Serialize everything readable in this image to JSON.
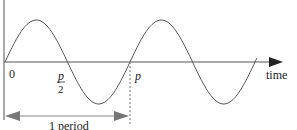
{
  "diagram": {
    "type": "sine-wave-period",
    "axis_label": "time",
    "origin_label": "0",
    "half_period_label": {
      "numerator": "p",
      "denominator": "2"
    },
    "period_label": "p",
    "span_label": "1 period",
    "cycles_shown": 2,
    "colors": {
      "curve": "#555555",
      "axis": "#555555",
      "arrow": "#666666"
    }
  }
}
